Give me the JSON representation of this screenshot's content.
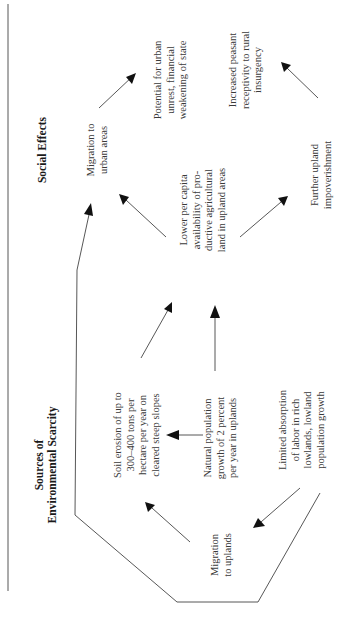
{
  "diagram": {
    "orientation": "rotated-90-ccw",
    "headers": {
      "social_effects": "Social Effects",
      "sources": "Sources of\nEnvironmental Scarcity"
    },
    "nodes": {
      "migration_urban": "Migration to\nurban areas",
      "urban_unrest": "Potential for urban\nunrest, financial\nweakening of state",
      "peasant_insurgency": "Increased peasant\nreceptivity to rural\ninsurgency",
      "lower_land": "Lower per capita\navailability of pro-\nductive agricultural\nland in upland areas",
      "upland_impoverishment": "Further upland\nimpoverishment",
      "soil_erosion": "Soil erosion of up to\n300–400 tons per\nhectare per year on\ncleared steep slopes",
      "natural_growth": "Natural population\ngrowth of 2 percent\nper year in uplands",
      "limited_absorption": "Limited absorption\nof labor in rich\nlowlands, lowland\npopulation growth",
      "migration_uplands": "Migration\nto uplands"
    },
    "edges": [
      {
        "from": "migration_urban",
        "to": "urban_unrest"
      },
      {
        "from": "lower_land",
        "to": "migration_urban"
      },
      {
        "from": "lower_land",
        "to": "upland_impoverishment"
      },
      {
        "from": "upland_impoverishment",
        "to": "peasant_insurgency"
      },
      {
        "from": "soil_erosion",
        "to": "lower_land"
      },
      {
        "from": "natural_growth",
        "to": "lower_land"
      },
      {
        "from": "natural_growth",
        "to": "soil_erosion"
      },
      {
        "from": "limited_absorption",
        "to": "migration_uplands"
      },
      {
        "from": "migration_uplands",
        "to": "soil_erosion"
      },
      {
        "from": "limited_absorption",
        "to": "migration_urban",
        "routed": true
      }
    ]
  }
}
